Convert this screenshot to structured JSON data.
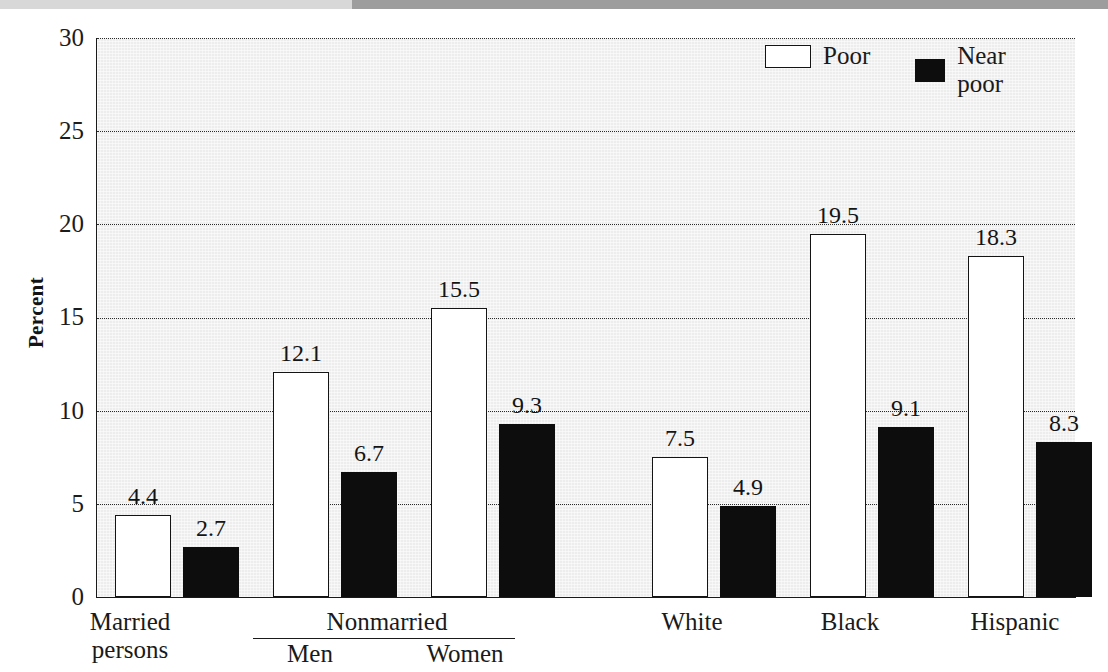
{
  "figure": {
    "background_color": "#ededed",
    "page_color": "#ffffff",
    "ink_color": "#141414"
  },
  "scan_artifact": {
    "left_band_color": "#d8d8d8",
    "right_band_color": "#9d9d9d"
  },
  "axis": {
    "ylabel": "Percent",
    "yticks": [
      "0",
      "5",
      "10",
      "15",
      "20",
      "25",
      "30"
    ]
  },
  "legend": {
    "items": [
      {
        "label": "Poor",
        "swatch": "white-square-outline",
        "color": "#ffffff"
      },
      {
        "label": "Near poor",
        "swatch": "black-square-filled",
        "color": "#0d0d0d"
      }
    ]
  },
  "categories": {
    "married": "Married\npersons",
    "nonmarried_bracket": "Nonmarried",
    "men": "Men",
    "women": "Women",
    "white": "White",
    "black": "Black",
    "hispanic": "Hispanic"
  },
  "chart_data": {
    "type": "bar",
    "title": "",
    "subtitle": "",
    "xlabel": "",
    "ylabel": "Percent",
    "ylim": [
      0,
      30
    ],
    "ytick_values": [
      0,
      5,
      10,
      15,
      20,
      25,
      30
    ],
    "grid": true,
    "grid_style": "dotted-horizontal",
    "legend_position": "top-right",
    "categories": [
      "Married persons",
      "Nonmarried Men",
      "Nonmarried Women",
      "White",
      "Black",
      "Hispanic"
    ],
    "series": [
      {
        "name": "Poor",
        "color": "#ffffff",
        "edge_color": "#141414",
        "values": [
          4.4,
          12.1,
          15.5,
          7.5,
          19.5,
          18.3
        ]
      },
      {
        "name": "Near poor",
        "color": "#0d0d0d",
        "edge_color": "#0d0d0d",
        "values": [
          2.7,
          6.7,
          9.3,
          4.9,
          9.1,
          8.3
        ]
      }
    ],
    "data_labels": [
      {
        "category": "Married persons",
        "series": "Poor",
        "value": "4.4"
      },
      {
        "category": "Married persons",
        "series": "Near poor",
        "value": "2.7"
      },
      {
        "category": "Nonmarried Men",
        "series": "Poor",
        "value": "12.1"
      },
      {
        "category": "Nonmarried Men",
        "series": "Near poor",
        "value": "6.7"
      },
      {
        "category": "Nonmarried Women",
        "series": "Poor",
        "value": "15.5"
      },
      {
        "category": "Nonmarried Women",
        "series": "Near poor",
        "value": "9.3"
      },
      {
        "category": "White",
        "series": "Poor",
        "value": "7.5"
      },
      {
        "category": "White",
        "series": "Near poor",
        "value": "4.9"
      },
      {
        "category": "Black",
        "series": "Poor",
        "value": "19.5"
      },
      {
        "category": "Black",
        "series": "Near poor",
        "value": "9.1"
      },
      {
        "category": "Hispanic",
        "series": "Poor",
        "value": "18.3"
      },
      {
        "category": "Hispanic",
        "series": "Near poor",
        "value": "8.3"
      }
    ]
  },
  "bars": [
    {
      "id": "married-poor",
      "value": "4.4",
      "num": 4.4,
      "kind": "poor",
      "x": 18,
      "w": 56
    },
    {
      "id": "married-near",
      "value": "2.7",
      "num": 2.7,
      "kind": "near",
      "x": 86,
      "w": 56
    },
    {
      "id": "men-poor",
      "value": "12.1",
      "num": 12.1,
      "kind": "poor",
      "x": 176,
      "w": 56
    },
    {
      "id": "men-near",
      "value": "6.7",
      "num": 6.7,
      "kind": "near",
      "x": 244,
      "w": 56
    },
    {
      "id": "women-poor",
      "value": "15.5",
      "num": 15.5,
      "kind": "poor",
      "x": 334,
      "w": 56
    },
    {
      "id": "women-near",
      "value": "9.3",
      "num": 9.3,
      "kind": "near",
      "x": 402,
      "w": 56
    },
    {
      "id": "white-poor",
      "value": "7.5",
      "num": 7.5,
      "kind": "poor",
      "x": 555,
      "w": 56
    },
    {
      "id": "white-near",
      "value": "4.9",
      "num": 4.9,
      "kind": "near",
      "x": 623,
      "w": 56
    },
    {
      "id": "black-poor",
      "value": "19.5",
      "num": 19.5,
      "kind": "poor",
      "x": 713,
      "w": 56
    },
    {
      "id": "black-near",
      "value": "9.1",
      "num": 9.1,
      "kind": "near",
      "x": 781,
      "w": 56
    },
    {
      "id": "hispanic-poor",
      "value": "18.3",
      "num": 18.3,
      "kind": "poor",
      "x": 871,
      "w": 56
    },
    {
      "id": "hispanic-near",
      "value": "8.3",
      "num": 8.3,
      "kind": "near",
      "x": 939,
      "w": 56
    }
  ]
}
